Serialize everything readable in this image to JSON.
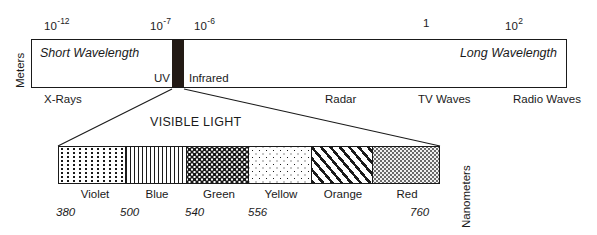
{
  "axis_top": {
    "unit_label": "Meters",
    "ticks": [
      {
        "base": "10",
        "exp": "-12",
        "x": 44
      },
      {
        "base": "10",
        "exp": "-7",
        "x": 150
      },
      {
        "base": "10",
        "exp": "-6",
        "x": 194
      },
      {
        "base": "1",
        "exp": "",
        "x": 423
      },
      {
        "base": "10",
        "exp": "2",
        "x": 505
      }
    ]
  },
  "spectrum": {
    "short_wavelength_label": "Short Wavelength",
    "long_wavelength_label": "Long Wavelength",
    "uv_label": "UV",
    "infrared_label": "Infrared",
    "visible_band_color": "#231a15",
    "bands": [
      {
        "label": "X-Rays",
        "x": 44
      },
      {
        "label": "Radar",
        "x": 325
      },
      {
        "label": "TV Waves",
        "x": 418
      },
      {
        "label": "Radio Waves",
        "x": 513
      }
    ]
  },
  "visible_light": {
    "title": "VISIBLE LIGHT",
    "unit_label": "Nanometers",
    "segments": [
      {
        "name": "Violet",
        "pattern": "fine-vertical-dots",
        "width_px": 67,
        "label_x": 64,
        "label_w": 62
      },
      {
        "name": "Blue",
        "pattern": "vertical-lines",
        "width_px": 62,
        "label_x": 126,
        "label_w": 62
      },
      {
        "name": "Green",
        "pattern": "dense-checker-dots",
        "width_px": 62,
        "label_x": 188,
        "label_w": 62
      },
      {
        "name": "Yellow",
        "pattern": "sparse-dots",
        "width_px": 63,
        "label_x": 250,
        "label_w": 62
      },
      {
        "name": "Orange",
        "pattern": "diagonal-hatch",
        "width_px": 62,
        "label_x": 312,
        "label_w": 62
      },
      {
        "name": "Red",
        "pattern": "dark-stipple",
        "width_px": 66,
        "label_x": 374,
        "label_w": 66
      }
    ],
    "wavelength_markers": [
      {
        "value": "380",
        "x": 56
      },
      {
        "value": "500",
        "x": 120
      },
      {
        "value": "540",
        "x": 185
      },
      {
        "value": "556",
        "x": 248
      },
      {
        "value": "760",
        "x": 410
      }
    ]
  },
  "bottom_caption": {
    "text": ""
  }
}
